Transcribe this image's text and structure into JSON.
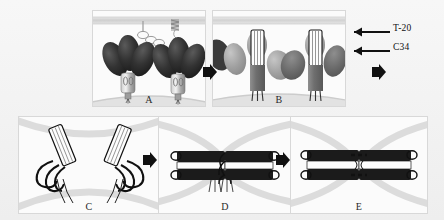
{
  "figure": {
    "width": 444,
    "height": 220,
    "background": "#f2f2f2"
  },
  "panels": [
    {
      "id": "A",
      "letter": "A",
      "caption": "Native prefusion Env trimer with gp120 cap and gp41 stalk; CD4 receptor and T-20 peptide in the target membrane",
      "x": 92,
      "y": 10,
      "w": 112,
      "h": 95
    },
    {
      "id": "B",
      "letter": "B",
      "caption": "Prehairpin intermediate: gp41 N-helix coiled coil exposed; T-20 and C34 binding sites",
      "x": 212,
      "y": 10,
      "w": 132,
      "h": 95
    },
    {
      "id": "C",
      "letter": "C",
      "caption": "Fusion peptides inserted into target membrane, extended prehairpin conformation",
      "x": 18,
      "y": 116,
      "w": 140,
      "h": 96
    },
    {
      "id": "D",
      "letter": "D",
      "caption": "Collapse into six-helix bundle, hemifusion of apposed membranes",
      "x": 158,
      "y": 116,
      "w": 132,
      "h": 96
    },
    {
      "id": "E",
      "letter": "E",
      "caption": "Fusion pore formation and completion of membrane merger",
      "x": 290,
      "y": 116,
      "w": 136,
      "h": 96
    }
  ],
  "annotations": [
    {
      "id": "t20",
      "label": "T-20",
      "x": 393,
      "y": 26,
      "arrow_from_x": 390,
      "arrow_to_x": 348,
      "arrow_y": 31
    },
    {
      "id": "c34",
      "label": "C34",
      "x": 393,
      "y": 45,
      "arrow_from_x": 390,
      "arrow_to_x": 348,
      "arrow_y": 50
    }
  ],
  "flow_arrows": [
    {
      "id": "a-to-b",
      "x": 204,
      "y": 72,
      "direction": "right"
    },
    {
      "id": "b-to-next",
      "x": 374,
      "y": 72,
      "direction": "right"
    },
    {
      "id": "c-to-d",
      "x": 146,
      "y": 158,
      "direction": "right"
    },
    {
      "id": "d-to-e",
      "x": 280,
      "y": 158,
      "direction": "right"
    }
  ],
  "colors": {
    "gp120_dark": "#2e2e2e",
    "gp120_mid": "#8e8e8e",
    "gp120_light": "#b6b6b6",
    "gp41_stalk": "#9a9a9a",
    "helix_bundle_dark": "#1c1c1c",
    "membrane": "#d5d5d5",
    "arrow": "#111111",
    "panel_bg": "#fbfbfb",
    "panel_border": "#d8d8d8",
    "label_text": "#111111"
  },
  "legend_terms": {
    "t20": "T-20",
    "c34": "C34"
  }
}
